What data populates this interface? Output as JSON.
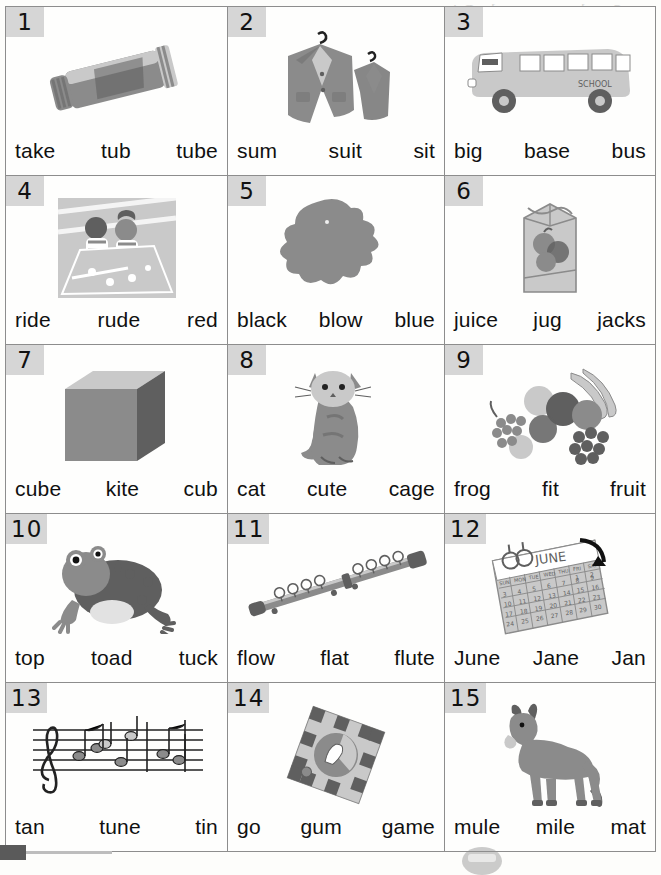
{
  "page": {
    "kind": "phonics-worksheet",
    "ghost_text": "part Say the new words. Print\nthe letters you hear. Circle\nthe words",
    "grid": {
      "columns": 3,
      "rows": 5,
      "total_cells": 15
    },
    "footer": {
      "tab_marker": "",
      "seal_watermark": ""
    }
  },
  "cells": [
    {
      "number": "1",
      "picture": "toothpaste-tube-icon",
      "words": [
        "take",
        "tub",
        "tube"
      ]
    },
    {
      "number": "2",
      "picture": "suit-on-hanger-icon",
      "words": [
        "sum",
        "suit",
        "sit"
      ]
    },
    {
      "number": "3",
      "picture": "school-bus-icon",
      "words": [
        "big",
        "base",
        "bus"
      ]
    },
    {
      "number": "4",
      "picture": "children-riding-icon",
      "words": [
        "ride",
        "rude",
        "red"
      ]
    },
    {
      "number": "5",
      "picture": "blue-blob-icon",
      "words": [
        "black",
        "blow",
        "blue"
      ]
    },
    {
      "number": "6",
      "picture": "juice-carton-icon",
      "words": [
        "juice",
        "jug",
        "jacks"
      ]
    },
    {
      "number": "7",
      "picture": "cube-icon",
      "words": [
        "cube",
        "kite",
        "cub"
      ]
    },
    {
      "number": "8",
      "picture": "cat-icon",
      "words": [
        "cat",
        "cute",
        "cage"
      ]
    },
    {
      "number": "9",
      "picture": "fruit-pile-icon",
      "words": [
        "frog",
        "fit",
        "fruit"
      ]
    },
    {
      "number": "10",
      "picture": "frog-icon",
      "words": [
        "top",
        "toad",
        "tuck"
      ]
    },
    {
      "number": "11",
      "picture": "flute-icon",
      "words": [
        "flow",
        "flat",
        "flute"
      ]
    },
    {
      "number": "12",
      "picture": "june-calendar-icon",
      "words": [
        "June",
        "Jane",
        "Jan"
      ],
      "picture_text": "JUNE"
    },
    {
      "number": "13",
      "picture": "music-staff-icon",
      "words": [
        "tan",
        "tune",
        "tin"
      ]
    },
    {
      "number": "14",
      "picture": "board-game-icon",
      "words": [
        "go",
        "gum",
        "game"
      ]
    },
    {
      "number": "15",
      "picture": "mule-icon",
      "words": [
        "mule",
        "mile",
        "mat"
      ]
    }
  ],
  "colors": {
    "rule": "#8d8d8d",
    "badge": "#d6d6d6",
    "ink": "#101010",
    "paper": "#fefefd",
    "art_gray": "#8b8b8b",
    "art_dark": "#5f5f5f",
    "art_light": "#c9c9c9"
  }
}
